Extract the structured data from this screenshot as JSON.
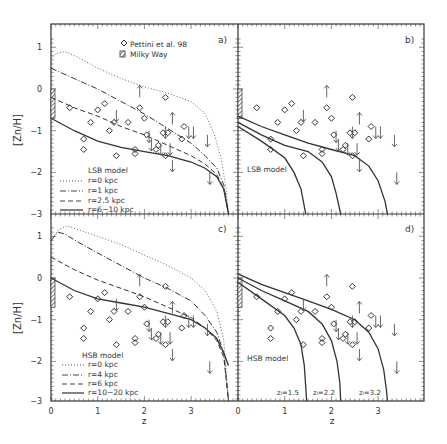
{
  "figure": {
    "ylabel": "[Zn/H]",
    "xlabel": "z",
    "x_ticks": [
      "0",
      "1",
      "2",
      "3"
    ],
    "y_ticks_top": [
      "1",
      "0",
      "−1",
      "−2",
      "−3"
    ],
    "y_ticks_bottom": [
      "1",
      "0",
      "−1",
      "−2",
      "−3"
    ],
    "legend_data": {
      "observed": "Pettini et al. 98",
      "milky_way": "Milky Way"
    },
    "panels": {
      "a": {
        "label": "a)",
        "model": "LSB model",
        "lines": [
          "r=0  kpc",
          "r=1  kpc",
          "r=2.5  kpc",
          "r=6−10  kpc"
        ]
      },
      "b": {
        "label": "b)",
        "model": "LSB model"
      },
      "c": {
        "label": "c)",
        "model": "HSB model",
        "lines": [
          "r=0  kpc",
          "r=4  kpc",
          "r=6  kpc",
          "r=10−20  kpc"
        ]
      },
      "d": {
        "label": "d)",
        "model": "HSB model",
        "zf_labels": [
          "zₗ=1.5",
          "zₗ=2.2",
          "zₗ=3.2"
        ]
      }
    }
  },
  "chart_data": [
    {
      "type": "scatter",
      "panel": "a",
      "title": "a) LSB model",
      "xlabel": "z",
      "ylabel": "[Zn/H]",
      "xlim": [
        0,
        4
      ],
      "ylim": [
        -3,
        1.4
      ],
      "series": [
        {
          "name": "Pettini et al. 98 (detections)",
          "x": [
            0.4,
            0.7,
            0.7,
            0.85,
            1.0,
            1.15,
            1.25,
            1.35,
            1.4,
            1.65,
            1.8,
            1.8,
            1.9,
            2.0,
            2.05,
            2.25,
            2.3,
            2.4,
            2.45,
            2.45,
            2.5,
            2.8,
            2.85
          ],
          "y": [
            -0.45,
            -1.2,
            -1.45,
            -0.8,
            -0.5,
            -0.35,
            -1.0,
            -0.8,
            -1.6,
            -0.8,
            -1.45,
            -1.55,
            -0.45,
            -0.7,
            -1.1,
            -1.45,
            -1.35,
            -1.05,
            -0.2,
            -1.6,
            -1.05,
            -1.2,
            -0.9
          ]
        },
        {
          "name": "Upper limits",
          "x": [
            1.4,
            2.1,
            2.15,
            2.35,
            2.45,
            2.55,
            2.6,
            2.95,
            3.05,
            3.35,
            3.4
          ],
          "y": [
            -0.5,
            -1.0,
            -1.2,
            -1.3,
            -0.9,
            -1.3,
            -1.7,
            -0.9,
            -0.9,
            -1.1,
            -2.0
          ]
        },
        {
          "name": "Lower limits",
          "x": [
            1.9,
            2.6
          ],
          "y": [
            -0.2,
            -0.85
          ]
        },
        {
          "name": "r=0 kpc",
          "style": "dotted",
          "x": [
            0,
            0.1,
            0.3,
            0.6,
            1,
            1.5,
            2,
            2.5,
            3,
            3.3,
            3.5,
            3.65,
            3.75,
            3.8
          ],
          "y": [
            0.7,
            0.85,
            0.9,
            0.75,
            0.5,
            0.25,
            0.05,
            -0.1,
            -0.3,
            -0.6,
            -1.1,
            -1.7,
            -2.4,
            -3.0
          ]
        },
        {
          "name": "r=1 kpc",
          "style": "dash-dot",
          "x": [
            0,
            0.5,
            1,
            1.5,
            2,
            2.5,
            3,
            3.3,
            3.55,
            3.7,
            3.8
          ],
          "y": [
            0.5,
            0.25,
            0.0,
            -0.3,
            -0.6,
            -0.95,
            -1.3,
            -1.6,
            -1.9,
            -2.3,
            -3.0
          ]
        },
        {
          "name": "r=2.5 kpc",
          "style": "dashed",
          "x": [
            0,
            0.5,
            1,
            1.5,
            2,
            2.5,
            3,
            3.3,
            3.55,
            3.7,
            3.8
          ],
          "y": [
            -0.2,
            -0.45,
            -0.65,
            -0.9,
            -1.1,
            -1.35,
            -1.6,
            -1.8,
            -2.05,
            -2.4,
            -3.0
          ]
        },
        {
          "name": "r=6-10 kpc",
          "style": "solid",
          "x": [
            0,
            0.5,
            1,
            1.5,
            2,
            2.5,
            3,
            3.3,
            3.55,
            3.7,
            3.8
          ],
          "y": [
            -0.7,
            -1.0,
            -1.25,
            -1.4,
            -1.5,
            -1.6,
            -1.75,
            -1.9,
            -2.1,
            -2.4,
            -3.0
          ]
        }
      ]
    },
    {
      "type": "scatter",
      "panel": "b",
      "title": "b) LSB model",
      "xlabel": "z",
      "ylabel": "[Zn/H]",
      "xlim": [
        0,
        4
      ],
      "ylim": [
        -3,
        1.4
      ],
      "series": [
        {
          "name": "zf=1.5",
          "style": "solid",
          "x": [
            0,
            0.5,
            1,
            1.2,
            1.35,
            1.4,
            1.45
          ],
          "y": [
            -0.9,
            -1.25,
            -1.65,
            -2.0,
            -2.4,
            -2.7,
            -3.0
          ]
        },
        {
          "name": "zf=2.2",
          "style": "solid",
          "x": [
            0,
            0.5,
            1,
            1.5,
            1.8,
            2.0,
            2.1,
            2.2
          ],
          "y": [
            -0.8,
            -1.1,
            -1.35,
            -1.5,
            -1.75,
            -2.1,
            -2.5,
            -3.0
          ]
        },
        {
          "name": "zf=3.2",
          "style": "solid",
          "x": [
            0,
            0.5,
            1,
            1.5,
            2,
            2.5,
            2.8,
            3.0,
            3.15,
            3.2
          ],
          "y": [
            -0.65,
            -0.9,
            -1.1,
            -1.3,
            -1.45,
            -1.6,
            -1.85,
            -2.2,
            -2.7,
            -3.0
          ]
        }
      ]
    },
    {
      "type": "scatter",
      "panel": "c",
      "title": "c) HSB model",
      "xlabel": "z",
      "ylabel": "[Zn/H]",
      "xlim": [
        0,
        4
      ],
      "ylim": [
        -3,
        1.4
      ],
      "series": [
        {
          "name": "r=0 kpc",
          "style": "dotted",
          "x": [
            0,
            0.15,
            0.35,
            0.6,
            1,
            1.5,
            2,
            2.5,
            3,
            3.3,
            3.55,
            3.7,
            3.8
          ],
          "y": [
            0.9,
            1.15,
            1.25,
            1.15,
            1.0,
            0.8,
            0.55,
            0.3,
            0.0,
            -0.3,
            -0.8,
            -1.5,
            -3.0
          ]
        },
        {
          "name": "r=4 kpc",
          "style": "dash-dot",
          "x": [
            0,
            0.15,
            0.3,
            0.6,
            1,
            1.5,
            2,
            2.5,
            3,
            3.3,
            3.55,
            3.7,
            3.8
          ],
          "y": [
            0.9,
            1.1,
            1.05,
            0.85,
            0.6,
            0.3,
            0.0,
            -0.25,
            -0.55,
            -0.9,
            -1.3,
            -1.8,
            -3.0
          ]
        },
        {
          "name": "r=6 kpc",
          "style": "dashed",
          "x": [
            0,
            0.5,
            1,
            1.5,
            2,
            2.5,
            3,
            3.3,
            3.55,
            3.7,
            3.8
          ],
          "y": [
            0.5,
            0.2,
            -0.05,
            -0.25,
            -0.45,
            -0.7,
            -0.95,
            -1.2,
            -1.5,
            -1.9,
            -3.0
          ]
        },
        {
          "name": "r=10-20 kpc",
          "style": "solid",
          "x": [
            0,
            0.5,
            1,
            1.5,
            2,
            2.5,
            3,
            3.3,
            3.55,
            3.7,
            3.8
          ],
          "y": [
            0.0,
            -0.3,
            -0.5,
            -0.6,
            -0.7,
            -0.85,
            -1.0,
            -1.2,
            -1.45,
            -1.8,
            -2.1
          ]
        }
      ]
    },
    {
      "type": "scatter",
      "panel": "d",
      "title": "d) HSB model",
      "xlabel": "z",
      "ylabel": "[Zn/H]",
      "xlim": [
        0,
        4
      ],
      "ylim": [
        -3,
        1.4
      ],
      "series": [
        {
          "name": "zf=1.5",
          "style": "solid",
          "x": [
            0,
            0.5,
            1,
            1.2,
            1.35,
            1.42,
            1.45,
            1.47
          ],
          "y": [
            -0.1,
            -0.5,
            -0.9,
            -1.2,
            -1.6,
            -2.1,
            -2.6,
            -3.0
          ]
        },
        {
          "name": "zf=2.2",
          "style": "solid",
          "x": [
            0,
            0.5,
            1,
            1.5,
            1.8,
            2.0,
            2.12,
            2.18,
            2.2
          ],
          "y": [
            0.0,
            -0.3,
            -0.55,
            -0.8,
            -1.1,
            -1.5,
            -2.0,
            -2.5,
            -3.0
          ]
        },
        {
          "name": "zf=3.2",
          "style": "solid",
          "x": [
            0,
            0.5,
            1,
            1.5,
            2,
            2.5,
            2.8,
            3.0,
            3.12,
            3.18,
            3.2
          ],
          "y": [
            0.1,
            -0.15,
            -0.35,
            -0.55,
            -0.75,
            -1.0,
            -1.3,
            -1.7,
            -2.2,
            -2.7,
            -3.0
          ]
        }
      ]
    }
  ]
}
